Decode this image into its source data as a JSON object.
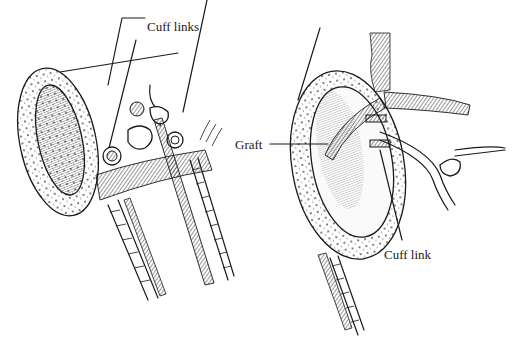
{
  "diagram": {
    "panels": [
      {
        "id": "left",
        "description": "end-to-end vessel with cuff links and knotted suture"
      },
      {
        "id": "right",
        "description": "vessel cross-section with graft and cuff link"
      }
    ],
    "labels": {
      "cuff_links": "Cuff links",
      "graft": "Graft",
      "cuff_link": "Cuff link"
    },
    "colors": {
      "ink": "#1a1a1a",
      "background": "#ffffff"
    }
  }
}
